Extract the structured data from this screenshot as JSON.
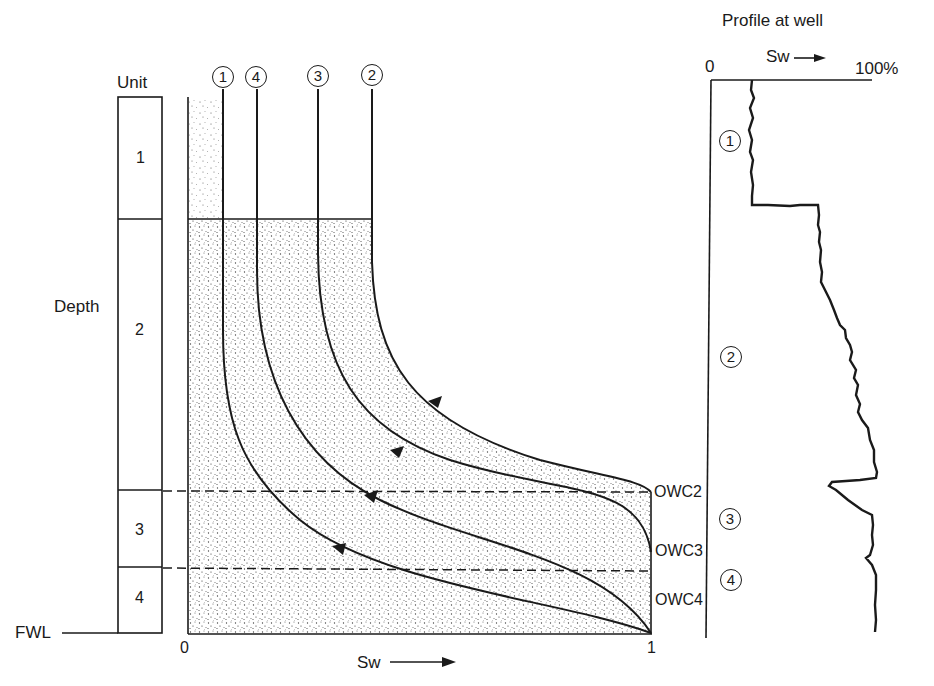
{
  "title": "Profile at well",
  "unit_column": {
    "header": "Unit",
    "units": [
      "1",
      "2",
      "3",
      "4"
    ],
    "depth_label": "Depth",
    "fwl_label": "FWL"
  },
  "main_plot": {
    "x_axis_label": "Sw",
    "x_min": "0",
    "x_max": "1",
    "curve_labels": [
      "1",
      "4",
      "3",
      "2"
    ],
    "contacts": [
      "OWC2",
      "OWC3",
      "OWC4"
    ]
  },
  "profile": {
    "title": "Profile at well",
    "x_axis_label": "Sw",
    "x_min": "0",
    "x_max": "100%",
    "unit_markers": [
      "1",
      "2",
      "3",
      "4"
    ]
  },
  "colors": {
    "ink": "#1a1a1a",
    "stipple": "#555555",
    "background": "#ffffff"
  }
}
